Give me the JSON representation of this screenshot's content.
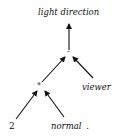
{
  "diagram": {
    "type": "expression-tree",
    "nodes": {
      "root_label": "light direction",
      "minus_op": "-",
      "times_op": "*",
      "viewer": "viewer",
      "two": "2",
      "normal": "normal",
      "normal_suffix": "."
    },
    "edges": [
      {
        "from": "minus_op",
        "to": "root_label"
      },
      {
        "from": "times_op",
        "to": "minus_op"
      },
      {
        "from": "viewer",
        "to": "minus_op"
      },
      {
        "from": "two",
        "to": "times_op"
      },
      {
        "from": "normal",
        "to": "times_op"
      }
    ],
    "colors": {
      "ink": "#111111",
      "background": "#ffffff"
    }
  }
}
